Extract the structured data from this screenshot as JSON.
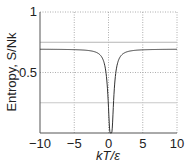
{
  "chart_data": {
    "type": "line",
    "title": "",
    "xlabel": "kT/ε",
    "ylabel": "Entropy, S/Nk",
    "xlim": [
      -10,
      10
    ],
    "ylim": [
      0,
      1
    ],
    "xticks": [
      -10,
      -5,
      0,
      5,
      10
    ],
    "xtick_labels": [
      "−10",
      "−5",
      "0",
      "5",
      "10"
    ],
    "yticks": [
      0.5,
      1
    ],
    "ytick_labels": [
      "0.5",
      "1"
    ],
    "grid": true,
    "reference_lines": [
      {
        "y": 0.75,
        "style": "solid-gray"
      },
      {
        "y": 0.25,
        "style": "solid-light-gray"
      }
    ],
    "series": [
      {
        "name": "S/Nk",
        "x": [
          -10,
          -8,
          -6,
          -5,
          -4,
          -3,
          -2,
          -1.5,
          -1,
          -0.7,
          -0.5,
          -0.3,
          -0.15,
          0,
          0.15,
          0.3,
          0.5,
          0.7,
          1,
          1.5,
          2,
          3,
          4,
          5,
          6,
          8,
          10
        ],
        "values": [
          0.692,
          0.691,
          0.69,
          0.688,
          0.685,
          0.68,
          0.664,
          0.639,
          0.583,
          0.497,
          0.393,
          0.15,
          0.01,
          0,
          0.01,
          0.15,
          0.393,
          0.497,
          0.583,
          0.639,
          0.664,
          0.68,
          0.685,
          0.688,
          0.69,
          0.691,
          0.692
        ],
        "color": "#333333"
      }
    ],
    "legend": null
  }
}
